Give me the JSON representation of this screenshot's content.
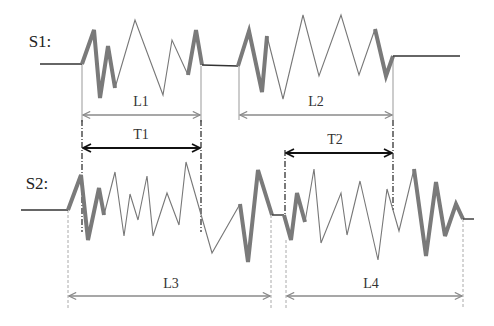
{
  "labels": {
    "s1": "S1:",
    "s2": "S2:",
    "l1": "L1",
    "l2": "L2",
    "l3": "L3",
    "l4": "L4",
    "t1": "T1",
    "t2": "T2"
  },
  "colors": {
    "signal_thin": "#777777",
    "signal_thick": "#7a7a7a",
    "baseline": "#333333",
    "gray_arrow": "#8a8a8a",
    "black_arrow": "#111111"
  },
  "signals": {
    "s1": {
      "baseline_y": 64,
      "segments": [
        {
          "type": "flat",
          "points": [
            [
              40,
              64
            ],
            [
              82,
              64
            ]
          ]
        },
        {
          "type": "thick",
          "points": [
            [
              82,
              64
            ],
            [
              94,
              30
            ],
            [
              100,
              98
            ],
            [
              108,
              46
            ],
            [
              115,
              88
            ]
          ]
        },
        {
          "type": "thin",
          "points": [
            [
              115,
              88
            ],
            [
              135,
              20
            ],
            [
              163,
              95
            ],
            [
              172,
              40
            ],
            [
              188,
              75
            ]
          ]
        },
        {
          "type": "thick",
          "points": [
            [
              188,
              75
            ],
            [
              196,
              30
            ],
            [
              202,
              65
            ]
          ]
        },
        {
          "type": "flat",
          "points": [
            [
              202,
              65
            ],
            [
              238,
              66
            ]
          ]
        },
        {
          "type": "thick",
          "points": [
            [
              238,
              66
            ],
            [
              249,
              31
            ],
            [
              262,
              92
            ],
            [
              267,
              36
            ]
          ]
        },
        {
          "type": "thin",
          "points": [
            [
              267,
              36
            ],
            [
              283,
              99
            ],
            [
              303,
              15
            ],
            [
              319,
              76
            ],
            [
              341,
              15
            ],
            [
              359,
              75
            ],
            [
              375,
              29
            ]
          ]
        },
        {
          "type": "thick",
          "points": [
            [
              375,
              29
            ],
            [
              386,
              76
            ],
            [
              393,
              56
            ]
          ]
        },
        {
          "type": "flat",
          "points": [
            [
              393,
              56
            ],
            [
              460,
              56
            ]
          ]
        }
      ]
    },
    "s2": {
      "segments": [
        {
          "type": "flat",
          "points": [
            [
              21,
              210
            ],
            [
              68,
              210
            ]
          ]
        },
        {
          "type": "thick",
          "points": [
            [
              68,
              210
            ],
            [
              81,
              175
            ],
            [
              88,
              240
            ],
            [
              99,
              188
            ],
            [
              104,
              215
            ]
          ]
        },
        {
          "type": "thin",
          "points": [
            [
              104,
              215
            ],
            [
              115,
              172
            ],
            [
              124,
              236
            ],
            [
              130,
              194
            ],
            [
              138,
              220
            ],
            [
              147,
              176
            ],
            [
              153,
              236
            ],
            [
              167,
              193
            ],
            [
              179,
              225
            ],
            [
              186,
              162
            ],
            [
              212,
              253
            ],
            [
              240,
              204
            ]
          ]
        },
        {
          "type": "thick",
          "points": [
            [
              240,
              204
            ],
            [
              248,
              262
            ],
            [
              258,
              170
            ],
            [
              272,
              215
            ]
          ]
        },
        {
          "type": "flat",
          "points": [
            [
              272,
              215
            ],
            [
              284,
              215
            ]
          ]
        },
        {
          "type": "thick",
          "points": [
            [
              284,
              215
            ],
            [
              291,
              240
            ],
            [
              297,
              193
            ],
            [
              305,
              222
            ]
          ]
        },
        {
          "type": "thin",
          "points": [
            [
              305,
              222
            ],
            [
              314,
              169
            ],
            [
              321,
              243
            ],
            [
              341,
              193
            ],
            [
              347,
              235
            ],
            [
              360,
              181
            ],
            [
              378,
              260
            ],
            [
              387,
              189
            ],
            [
              399,
              231
            ],
            [
              414,
              169
            ]
          ]
        },
        {
          "type": "thick",
          "points": [
            [
              414,
              169
            ],
            [
              426,
              256
            ],
            [
              436,
              182
            ],
            [
              445,
              236
            ],
            [
              456,
              204
            ],
            [
              463,
              219
            ]
          ]
        },
        {
          "type": "flat",
          "points": [
            [
              463,
              219
            ],
            [
              474,
              219
            ]
          ]
        }
      ]
    }
  },
  "dimensions": [
    {
      "id": "L1",
      "kind": "gray",
      "x1": 82,
      "x2": 201,
      "y": 115,
      "label_x": 141,
      "label_y": 102
    },
    {
      "id": "L2",
      "kind": "gray",
      "x1": 239,
      "x2": 393,
      "y": 115,
      "label_x": 316,
      "label_y": 102
    },
    {
      "id": "T1",
      "kind": "black",
      "x1": 82,
      "x2": 201,
      "y": 148,
      "label_x": 141,
      "label_y": 135
    },
    {
      "id": "T2",
      "kind": "black",
      "x1": 285,
      "x2": 393,
      "y": 153,
      "label_x": 335,
      "label_y": 140
    },
    {
      "id": "L3",
      "kind": "gray",
      "x1": 68,
      "x2": 271,
      "y": 296,
      "label_x": 171,
      "label_y": 284
    },
    {
      "id": "L4",
      "kind": "gray",
      "x1": 286,
      "x2": 463,
      "y": 296,
      "label_x": 371,
      "label_y": 284
    }
  ],
  "guide_lines": [
    {
      "x": 82,
      "y1": 64,
      "y2": 122,
      "style": "solid-gray"
    },
    {
      "x": 201,
      "y1": 66,
      "y2": 122,
      "style": "solid-gray"
    },
    {
      "x": 239,
      "y1": 66,
      "y2": 120,
      "style": "solid-gray"
    },
    {
      "x": 393,
      "y1": 57,
      "y2": 120,
      "style": "solid-gray"
    },
    {
      "x": 82,
      "y1": 120,
      "y2": 232,
      "style": "dashdot-black"
    },
    {
      "x": 201,
      "y1": 120,
      "y2": 232,
      "style": "dashdot-black"
    },
    {
      "x": 285,
      "y1": 150,
      "y2": 222,
      "style": "dashdot-black"
    },
    {
      "x": 393,
      "y1": 120,
      "y2": 210,
      "style": "dashdot-black"
    },
    {
      "x": 68,
      "y1": 210,
      "y2": 308,
      "style": "dashed-gray"
    },
    {
      "x": 271,
      "y1": 215,
      "y2": 308,
      "style": "dashed-gray"
    },
    {
      "x": 286,
      "y1": 240,
      "y2": 308,
      "style": "dashed-gray"
    },
    {
      "x": 463,
      "y1": 219,
      "y2": 308,
      "style": "dashed-gray"
    }
  ]
}
